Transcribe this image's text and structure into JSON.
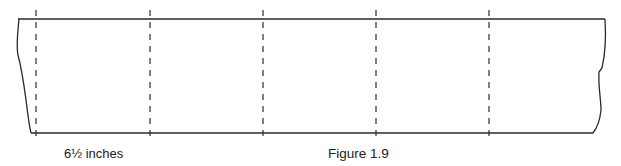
{
  "figure": {
    "caption": "Figure 1.9",
    "measurement_label": "6½ inches",
    "stroke_color": "#2a2a2a",
    "fold_lines": [
      {
        "id": "fold-1",
        "x": 36
      },
      {
        "id": "fold-2",
        "x": 150
      },
      {
        "id": "fold-3",
        "x": 263
      },
      {
        "id": "fold-4",
        "x": 376
      },
      {
        "id": "fold-5",
        "x": 489
      }
    ],
    "strip": {
      "top": 19,
      "bottom": 133,
      "left_edge": "torn",
      "right_edge": "torn"
    }
  }
}
